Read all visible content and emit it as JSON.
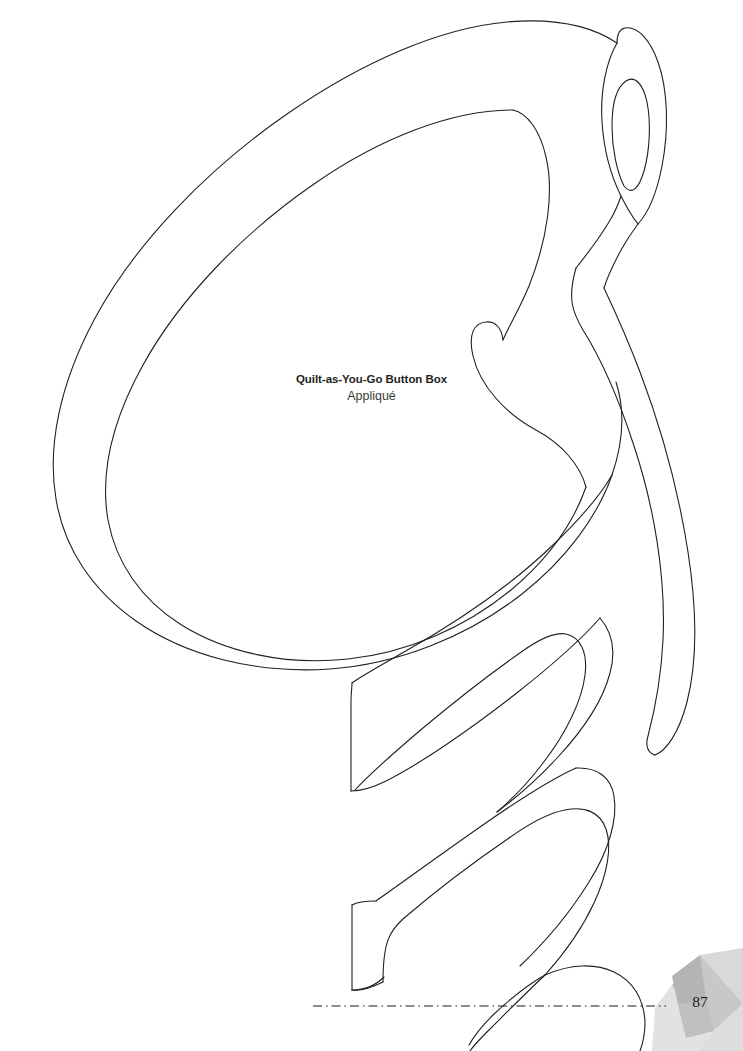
{
  "page": {
    "width": 743,
    "height": 1051,
    "background_color": "#ffffff",
    "line_color": "#231f20",
    "page_number": "87"
  },
  "label": {
    "title": "Quilt-as-You-Go Button Box",
    "subtitle": "Appliqué"
  },
  "pattern": {
    "name": "appliqué-leaf-template",
    "description": "Large curled leaf / feather appliqué outline with serpentine tail",
    "stroke_color": "#231f20",
    "stroke_width": "1.1",
    "fill": "none"
  },
  "fold_line": {
    "name": "dash-dot-fold-line",
    "style": "dash-dot",
    "color": "#1a1a1a",
    "y": 1006,
    "x_start": 313,
    "x_end": 666
  },
  "decoration": {
    "name": "pinwheel-ornament",
    "colors": {
      "petal_light": "#e3e3e3",
      "petal_mid": "#d2d2d2",
      "petal_dark": "#b6b6b6",
      "petal_darkest": "#a8a8a8"
    }
  }
}
